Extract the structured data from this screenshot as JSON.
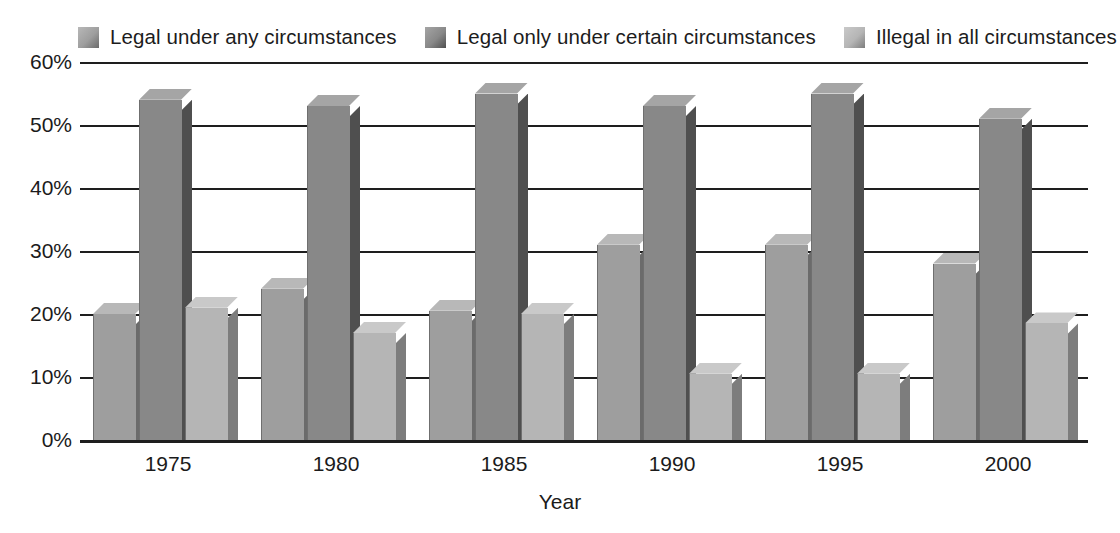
{
  "chart_data": {
    "type": "bar",
    "title": "",
    "subtitle": "",
    "xlabel": "Year",
    "ylabel": "",
    "categories": [
      "1975",
      "1980",
      "1985",
      "1990",
      "1995",
      "2000"
    ],
    "series": [
      {
        "name": "Legal under any circumstances",
        "color": "#9e9e9e",
        "side_color": "#6b6b6b",
        "top_color": "#b8b8b8",
        "values": [
          20,
          24,
          20.5,
          31,
          31,
          28
        ]
      },
      {
        "name": "Legal only under certain circumstances",
        "color": "#888888",
        "side_color": "#4f4f4f",
        "top_color": "#a5a5a5",
        "values": [
          54,
          53,
          55,
          53,
          55,
          51
        ]
      },
      {
        "name": "Illegal in all circumstances",
        "color": "#b5b5b5",
        "side_color": "#7d7d7d",
        "top_color": "#c9c9c9",
        "values": [
          21,
          17,
          20,
          10.5,
          10.5,
          18.5
        ]
      }
    ],
    "ylim": [
      0,
      60
    ],
    "ytick_values": [
      0,
      10,
      20,
      30,
      40,
      50,
      60
    ],
    "ytick_labels": [
      "0%",
      "10%",
      "20%",
      "30%",
      "40%",
      "50%",
      "60%"
    ],
    "grid": true,
    "legend_position": "top"
  },
  "legend": {
    "items": [
      {
        "label": "Legal under any circumstances"
      },
      {
        "label": "Legal only under certain circumstances"
      },
      {
        "label": "Illegal in all circumstances"
      }
    ]
  },
  "axes": {
    "x_title": "Year",
    "y_tick_labels": [
      "60%",
      "50%",
      "40%",
      "30%",
      "20%",
      "10%",
      "0%"
    ],
    "x_tick_labels": [
      "1975",
      "1980",
      "1985",
      "1990",
      "1995",
      "2000"
    ]
  }
}
